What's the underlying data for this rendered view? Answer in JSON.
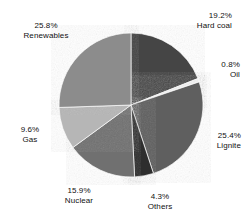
{
  "chart_data": {
    "type": "pie",
    "title": "",
    "subtitle": "",
    "xlabel": "",
    "ylabel": "",
    "legend_position": "none",
    "grid": false,
    "labels_outside": true,
    "total_percent": "100.0%",
    "categories": [
      "Hard coal",
      "Oil",
      "Lignite",
      "Others",
      "Nuclear",
      "Gas",
      "Renewables"
    ],
    "values": [
      19.2,
      0.8,
      25.4,
      4.3,
      15.9,
      9.6,
      25.8
    ],
    "colors": [
      "#454545",
      "#f2f2f2",
      "#5e5e5e",
      "#2f2f2f",
      "#6f6f6f",
      "#b6b6b6",
      "#8c8c8c"
    ],
    "slices": [
      {
        "name": "Hard coal",
        "value": 19.2,
        "percent_text": "19.2%",
        "label_text": "Hard coal",
        "color": "#454545",
        "start_angle": 0.0,
        "end_angle": 69.12
      },
      {
        "name": "Oil",
        "value": 0.8,
        "percent_text": "0.8%",
        "label_text": "Oil",
        "color": "#f2f2f2",
        "start_angle": 69.12,
        "end_angle": 72.0
      },
      {
        "name": "Lignite",
        "value": 25.4,
        "percent_text": "25.4%",
        "label_text": "Lignite",
        "color": "#5e5e5e",
        "start_angle": 72.0,
        "end_angle": 163.44
      },
      {
        "name": "Others",
        "value": 4.3,
        "percent_text": "4.3%",
        "label_text": "Others",
        "color": "#2f2f2f",
        "start_angle": 163.44,
        "end_angle": 178.92
      },
      {
        "name": "Nuclear",
        "value": 15.9,
        "percent_text": "15.9%",
        "label_text": "Nuclear",
        "color": "#6f6f6f",
        "start_angle": 178.92,
        "end_angle": 236.16
      },
      {
        "name": "Gas",
        "value": 9.6,
        "percent_text": "9.6%",
        "label_text": "Gas",
        "color": "#b6b6b6",
        "start_angle": 236.16,
        "end_angle": 270.72
      },
      {
        "name": "Renewables",
        "value": 25.8,
        "percent_text": "25.8%",
        "label_text": "Renewables",
        "color": "#8c8c8c",
        "start_angle": 270.72,
        "end_angle": 363.6
      }
    ]
  },
  "labels": {
    "hardcoal": {
      "percent": "19.2%",
      "name": "Hard coal"
    },
    "oil": {
      "percent": "0.8%",
      "name": "Oil"
    },
    "lignite": {
      "percent": "25.4%",
      "name": "Lignite"
    },
    "others": {
      "percent": "4.3%",
      "name": "Others"
    },
    "nuclear": {
      "percent": "15.9%",
      "name": "Nuclear"
    },
    "gas": {
      "percent": "9.6%",
      "name": "Gas"
    },
    "renewables": {
      "percent": "25.8%",
      "name": "Renewables"
    }
  },
  "style": {
    "background": "#ffffff",
    "text_color": "#111111",
    "pie_center_x": 131,
    "pie_center_y": 105,
    "pie_radius": 72
  }
}
